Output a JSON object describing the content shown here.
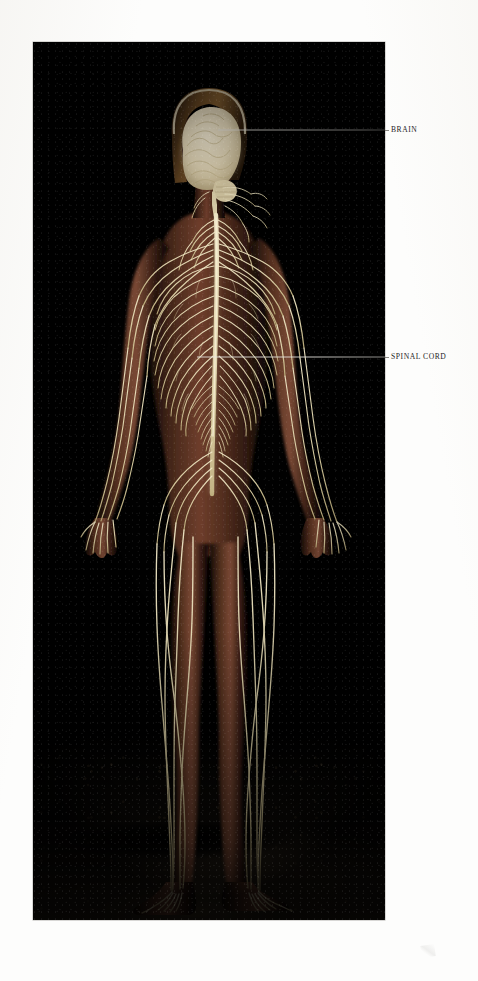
{
  "page": {
    "background_color": "#fdfdfc",
    "type": "anatomical-illustration-plate"
  },
  "plate": {
    "background_color": "#010101",
    "left": 33,
    "top": 42,
    "width": 352,
    "height": 878,
    "subject": "Human nervous system, full-body anterior view, female figure",
    "nerve_color": "#ded3a8",
    "brain_color": "#e6ddc6",
    "skin_color": "#4a2a1d",
    "ground_color": "#2e251a"
  },
  "labels": [
    {
      "id": "brain",
      "text": "BRAIN",
      "text_x": 390,
      "text_y": 126,
      "leader": {
        "x1": 218,
        "y1": 130,
        "x2": 385,
        "y2": 130,
        "paper_x1": 385,
        "paper_x2": 388
      }
    },
    {
      "id": "spinal-cord",
      "text": "SPINAL CORD",
      "text_x": 390,
      "text_y": 353,
      "leader": {
        "x1": 197,
        "y1": 357,
        "x2": 385,
        "y2": 357,
        "paper_x1": 385,
        "paper_x2": 388
      }
    }
  ],
  "structures": [
    {
      "name": "brain",
      "region": "head"
    },
    {
      "name": "spinal-cord",
      "region": "vertebral-column"
    },
    {
      "name": "cervical-plexus",
      "region": "neck"
    },
    {
      "name": "brachial-plexus",
      "region": "shoulder"
    },
    {
      "name": "intercostal-nerves",
      "region": "thorax"
    },
    {
      "name": "cauda-equina",
      "region": "lumbar"
    },
    {
      "name": "lumbosacral-plexus",
      "region": "pelvis"
    },
    {
      "name": "radial-ulnar-median-nerves",
      "region": "arm"
    },
    {
      "name": "sciatic-nerve",
      "region": "leg"
    },
    {
      "name": "tibial-peroneal-nerves",
      "region": "lower-leg"
    },
    {
      "name": "digital-nerves",
      "region": "hand-foot"
    }
  ],
  "colors": {
    "paper": "#fdfdfc",
    "plate_black": "#010101",
    "nerve": "#ded3a8",
    "nerve_highlight": "#f3ecd2",
    "brain": "#e6ddc6",
    "skin": "#4a2a1d",
    "label_text": "#26241f",
    "leader_on_photo": "#e9e7e2",
    "leader_on_paper": "#6e6c67",
    "ground": "#2e251a"
  }
}
